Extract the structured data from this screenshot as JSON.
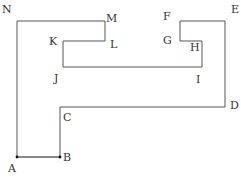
{
  "diagram": {
    "type": "polygon-outline",
    "stroke_color": "#555555",
    "highlight_segment_color": "#111111",
    "vertices": [
      {
        "label": "A",
        "x": 17,
        "y": 157
      },
      {
        "label": "B",
        "x": 60,
        "y": 157
      },
      {
        "label": "C",
        "x": 60,
        "y": 107
      },
      {
        "label": "D",
        "x": 225,
        "y": 107
      },
      {
        "label": "E",
        "x": 225,
        "y": 21
      },
      {
        "label": "F",
        "x": 180,
        "y": 21
      },
      {
        "label": "G",
        "x": 180,
        "y": 41
      },
      {
        "label": "H",
        "x": 202,
        "y": 41
      },
      {
        "label": "I",
        "x": 202,
        "y": 67
      },
      {
        "label": "J",
        "x": 63,
        "y": 67
      },
      {
        "label": "K",
        "x": 63,
        "y": 41
      },
      {
        "label": "L",
        "x": 105,
        "y": 41
      },
      {
        "label": "M",
        "x": 105,
        "y": 21
      },
      {
        "label": "N",
        "x": 17,
        "y": 21
      }
    ],
    "highlighted_segment": [
      "A",
      "B"
    ],
    "labels": {
      "A": "A",
      "B": "B",
      "C": "C",
      "D": "D",
      "E": "E",
      "F": "F",
      "G": "G",
      "H": "H",
      "I": "I",
      "J": "J",
      "K": "K",
      "L": "L",
      "M": "M",
      "N": "N"
    }
  }
}
